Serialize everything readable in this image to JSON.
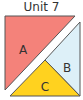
{
  "title": "Unit 7",
  "colors": {
    "piece_a": "#F4827A",
    "piece_b": "#DDF0F8",
    "piece_c": "#FFD21F",
    "outline": "#555555",
    "gap": "#ffffff"
  },
  "pieces": [
    {
      "id": "A",
      "label": "A",
      "shape": "right-triangle",
      "position": "upper-left"
    },
    {
      "id": "B",
      "label": "B",
      "shape": "triangle",
      "position": "right"
    },
    {
      "id": "C",
      "label": "C",
      "shape": "triangle",
      "position": "bottom"
    }
  ]
}
